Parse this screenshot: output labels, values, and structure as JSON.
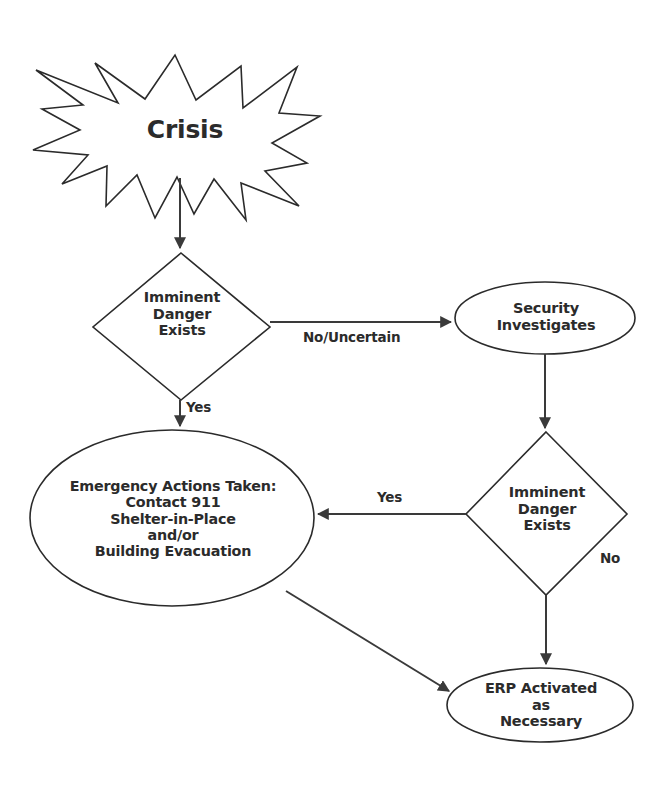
{
  "diagram": {
    "type": "flowchart",
    "background_color": "#ffffff",
    "line_color": "#3a3a3a",
    "text_color": "#2b2b2b",
    "nodes": [
      {
        "id": "crisis",
        "shape": "starburst",
        "label": "Crisis"
      },
      {
        "id": "imminent-danger-1",
        "shape": "diamond",
        "label": "Imminent\nDanger\nExists"
      },
      {
        "id": "security-investigates",
        "shape": "ellipse",
        "label": "Security\nInvestigates"
      },
      {
        "id": "emergency-actions",
        "shape": "ellipse",
        "label": "Emergency Actions Taken:\nContact 911\nShelter-in-Place\nand/or\nBuilding Evacuation"
      },
      {
        "id": "imminent-danger-2",
        "shape": "diamond",
        "label": "Imminent\nDanger\nExists"
      },
      {
        "id": "erp-activated",
        "shape": "ellipse",
        "label": "ERP Activated\nas\nNecessary"
      }
    ],
    "edges": [
      {
        "id": "crisis-to-diamond1",
        "from": "crisis",
        "to": "imminent-danger-1",
        "label": ""
      },
      {
        "id": "diamond1-to-security",
        "from": "imminent-danger-1",
        "to": "security-investigates",
        "label": "No/Uncertain"
      },
      {
        "id": "diamond1-to-emergency",
        "from": "imminent-danger-1",
        "to": "emergency-actions",
        "label": "Yes"
      },
      {
        "id": "security-to-diamond2",
        "from": "security-investigates",
        "to": "imminent-danger-2",
        "label": ""
      },
      {
        "id": "diamond2-to-emergency",
        "from": "imminent-danger-2",
        "to": "emergency-actions",
        "label": "Yes"
      },
      {
        "id": "diamond2-to-erp",
        "from": "imminent-danger-2",
        "to": "erp-activated",
        "label": "No"
      },
      {
        "id": "emergency-to-erp",
        "from": "emergency-actions",
        "to": "erp-activated",
        "label": ""
      }
    ]
  }
}
